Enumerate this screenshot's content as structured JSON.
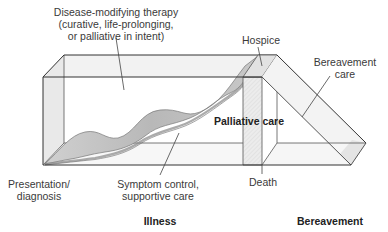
{
  "diagram": {
    "labels": {
      "disease_modifying_line1": "Disease-modifying therapy",
      "disease_modifying_line2": "(curative, life-prolonging,",
      "disease_modifying_line3": "or palliative in intent)",
      "hospice": "Hospice",
      "bereavement_care_line1": "Bereavement",
      "bereavement_care_line2": "care",
      "palliative_care": "Palliative care",
      "presentation_line1": "Presentation/",
      "presentation_line2": "diagnosis",
      "symptom_control_line1": "Symptom control,",
      "symptom_control_line2": "supportive care",
      "death": "Death",
      "illness": "Illness",
      "bereavement": "Bereavement"
    },
    "colors": {
      "stroke": "#333333",
      "box_fill": "#f4f4f4",
      "ribbon_fill": "#bdbdbd",
      "ribbon_edge": "#8a8a8a",
      "slab_fill": "#e6e6e6"
    }
  }
}
